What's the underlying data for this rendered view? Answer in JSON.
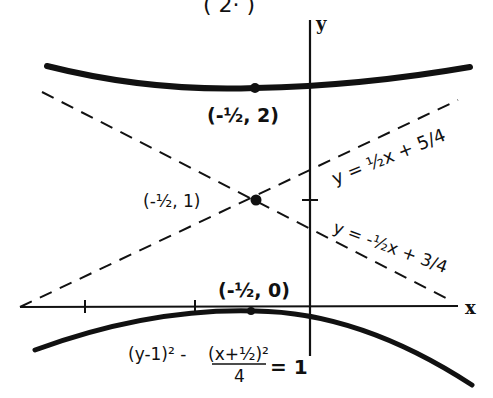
{
  "diagram": {
    "title_fragment": "( 2· )",
    "axes": {
      "x_label": "x",
      "y_label": "y"
    },
    "points": [
      {
        "id": "upper-vertex",
        "label": "(-½, 2)",
        "x": -0.5,
        "y": 2
      },
      {
        "id": "center",
        "label": "(-½, 1)",
        "x": -0.5,
        "y": 1
      },
      {
        "id": "lower-vertex",
        "label": "(-½, 0)",
        "x": -0.5,
        "y": 0
      }
    ],
    "asymptotes": [
      {
        "id": "asymptote-positive",
        "label": "y = ½x + 5/4",
        "style": "dashed"
      },
      {
        "id": "asymptote-negative",
        "label": "y = -½x + 3/4",
        "style": "dashed"
      }
    ],
    "curve": {
      "type": "hyperbola",
      "equation": "(y-1)² - (x+½)²/4 = 1",
      "equation_numerator_left": "(y-1)² -",
      "equation_numerator_right": "(x+½)²",
      "equation_denominator": "4",
      "equation_rhs": "= 1"
    },
    "colors": {
      "ink": "#111111",
      "background": "#ffffff"
    }
  }
}
